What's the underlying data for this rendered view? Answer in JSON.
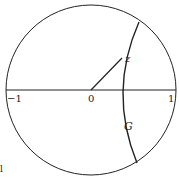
{
  "figure": {
    "labels": {
      "minus_one": "−1",
      "zero": "0",
      "one": "1",
      "z": "z",
      "g": "G",
      "corner_mark": "l"
    },
    "colors": {
      "stroke": "#222222",
      "background": "#ffffff"
    },
    "geometry": {
      "unit_circle": {
        "cx": 91,
        "cy": 90,
        "r": 85
      },
      "diameter": {
        "x1": 6,
        "y1": 90,
        "x2": 176,
        "y2": 90
      },
      "segment_0_to_z": {
        "x1": 91,
        "y1": 90,
        "x2": 122,
        "y2": 58
      },
      "arc_G": {
        "start": [
          139,
          22
        ],
        "through": [
          117,
          90
        ],
        "end": [
          137,
          163
        ]
      }
    }
  }
}
